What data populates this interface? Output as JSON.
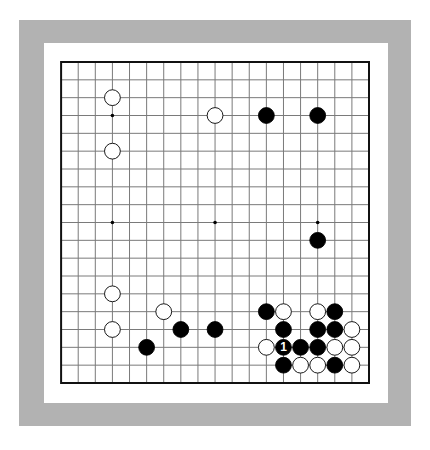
{
  "colors": {
    "frame": "#b2b2b2",
    "paper": "#ffffff",
    "grid": "#7a7a7a",
    "border": "#111111",
    "black_stone": "#000000",
    "white_stone": "#ffffff"
  },
  "board": {
    "size": 19,
    "left": 61.1,
    "top": 62,
    "right": 369,
    "bottom": 383,
    "star_points": [
      [
        3,
        3
      ],
      [
        9,
        3
      ],
      [
        15,
        3
      ],
      [
        3,
        9
      ],
      [
        9,
        9
      ],
      [
        15,
        9
      ],
      [
        3,
        15
      ],
      [
        9,
        15
      ],
      [
        15,
        15
      ]
    ],
    "stones": [
      {
        "color": "white",
        "col": 3,
        "row": 2
      },
      {
        "color": "white",
        "col": 3,
        "row": 5
      },
      {
        "color": "white",
        "col": 9,
        "row": 3
      },
      {
        "color": "black",
        "col": 12,
        "row": 3
      },
      {
        "color": "black",
        "col": 15,
        "row": 3
      },
      {
        "color": "black",
        "col": 15,
        "row": 10
      },
      {
        "color": "white",
        "col": 3,
        "row": 13
      },
      {
        "color": "white",
        "col": 3,
        "row": 15
      },
      {
        "color": "white",
        "col": 6,
        "row": 14
      },
      {
        "color": "black",
        "col": 7,
        "row": 15
      },
      {
        "color": "black",
        "col": 9,
        "row": 15
      },
      {
        "color": "black",
        "col": 5,
        "row": 16
      },
      {
        "color": "black",
        "col": 12,
        "row": 14
      },
      {
        "color": "white",
        "col": 13,
        "row": 14
      },
      {
        "color": "white",
        "col": 15,
        "row": 14
      },
      {
        "color": "black",
        "col": 16,
        "row": 14
      },
      {
        "color": "black",
        "col": 13,
        "row": 15
      },
      {
        "color": "black",
        "col": 15,
        "row": 15
      },
      {
        "color": "black",
        "col": 16,
        "row": 15
      },
      {
        "color": "white",
        "col": 17,
        "row": 15
      },
      {
        "color": "white",
        "col": 12,
        "row": 16
      },
      {
        "color": "black",
        "col": 13,
        "row": 16,
        "label": "1"
      },
      {
        "color": "black",
        "col": 14,
        "row": 16
      },
      {
        "color": "black",
        "col": 15,
        "row": 16
      },
      {
        "color": "white",
        "col": 16,
        "row": 16
      },
      {
        "color": "white",
        "col": 17,
        "row": 16
      },
      {
        "color": "black",
        "col": 13,
        "row": 17
      },
      {
        "color": "white",
        "col": 14,
        "row": 17
      },
      {
        "color": "white",
        "col": 15,
        "row": 17
      },
      {
        "color": "black",
        "col": 16,
        "row": 17
      },
      {
        "color": "white",
        "col": 17,
        "row": 17
      }
    ]
  }
}
